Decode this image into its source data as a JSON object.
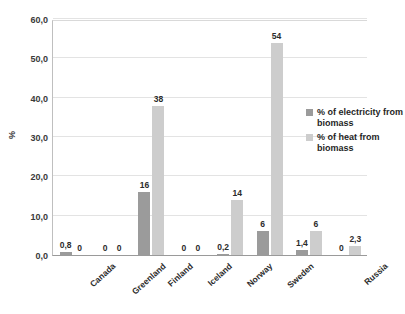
{
  "chart_data": {
    "type": "bar",
    "title": "",
    "subtitle": "",
    "xlabel": "",
    "ylabel": "%",
    "ylim": [
      0,
      60
    ],
    "ytick_labels": [
      "60,0",
      "50,0",
      "40,0",
      "30,0",
      "20,0",
      "10,0",
      "0,0"
    ],
    "ytick_values": [
      60,
      50,
      40,
      30,
      20,
      10,
      0
    ],
    "grid": true,
    "legend_position": "right",
    "categories": [
      "Canada",
      "Greenland",
      "Finland",
      "Iceland",
      "Norway",
      "Sweden",
      "",
      "Russia"
    ],
    "series": [
      {
        "name": "% of electricity from biomass",
        "color": "#9b9b9b",
        "values": [
          0.8,
          0,
          16,
          0,
          0.2,
          6,
          1.4,
          0
        ],
        "labels": [
          "0,8",
          "0",
          "16",
          "0",
          "0,2",
          "6",
          "1,4",
          "0"
        ]
      },
      {
        "name": "% of heat from biomass",
        "color": "#cdcdcd",
        "values": [
          0,
          0,
          38,
          0,
          14,
          54,
          6,
          2.3
        ],
        "labels": [
          "0",
          "0",
          "38",
          "0",
          "14",
          "54",
          "6",
          "2,3"
        ]
      }
    ]
  },
  "legend": {
    "items": [
      {
        "label": "% of electricity from biomass",
        "color": "#9b9b9b"
      },
      {
        "label": "% of heat from biomass",
        "color": "#cdcdcd"
      }
    ]
  }
}
